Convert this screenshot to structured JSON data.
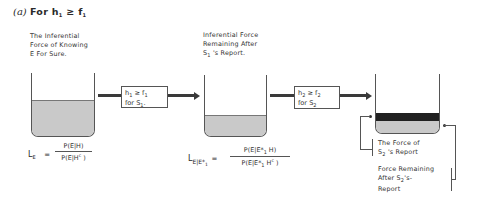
{
  "title": {
    "label": "(a)",
    "text_prefix": "For ",
    "var1": "h",
    "sub1": "1",
    "relation": " ≥ ",
    "var2": "f",
    "sub2": "1"
  },
  "stage1": {
    "caption_lines": [
      "The Inferential",
      "Force of Knowing",
      "E For Sure."
    ],
    "formula": {
      "lhs": "L",
      "lhs_sub": "E",
      "equals": "=",
      "numerator": "P(E|H)",
      "denominator": "P(E|H",
      "denominator_sup": "c",
      "denominator_end": " )"
    },
    "fill_level_pct": 57
  },
  "transform1": {
    "line1_var1": "h",
    "line1_sub1": "1",
    "line1_rel": " ≥ ",
    "line1_var2": "f",
    "line1_sub2": "1",
    "line2_prefix": "for S",
    "line2_sub": "1",
    "line2_suffix": "."
  },
  "stage2": {
    "caption_line1": "Inferential Force",
    "caption_line2": "Remaining After",
    "caption_line3_prefix": "S",
    "caption_line3_sub": "1",
    "caption_line3_suffix": " 's Report.",
    "formula": {
      "lhs": "L",
      "lhs_sub": "E|E*",
      "lhs_sub2": "1",
      "equals": "=",
      "numerator_pre": "P(E|E*",
      "numerator_sub": "1",
      "numerator_post": " H)",
      "denominator_pre": "P(E|E*",
      "denominator_sub": "1",
      "denominator_mid": " H",
      "denominator_sup": "c",
      "denominator_post": " )"
    },
    "fill_level_pct": 33
  },
  "transform2": {
    "line1_var1": "h",
    "line1_sub1": "2",
    "line1_rel": " ≥ ",
    "line1_var2": "f",
    "line1_sub2": "2",
    "line2_prefix": "for S",
    "line2_sub": "2",
    "line2_suffix": "."
  },
  "stage3": {
    "label_force_prefix": "The Force of",
    "label_force_line2_prefix": "S",
    "label_force_line2_sub": "2",
    "label_force_line2_suffix": " 's Report",
    "label_remaining_line1": "Force Remaining",
    "label_remaining_line2_prefix": "After S",
    "label_remaining_line2_sub": "2",
    "label_remaining_line2_suffix": "'s-",
    "label_remaining_line3": "Report"
  },
  "colors": {
    "ink": "#333333",
    "fill_light": "#c9c9c9",
    "fill_dark": "#4a4a4a",
    "arrow": "#3a3a3a"
  }
}
